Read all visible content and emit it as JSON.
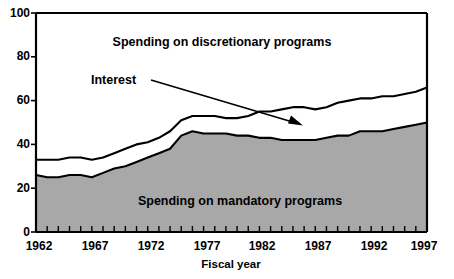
{
  "chart_data": {
    "type": "area",
    "title": "",
    "xlabel": "Fiscal year",
    "ylabel": "",
    "xlim": [
      1962,
      1997
    ],
    "ylim": [
      0,
      100
    ],
    "grid": false,
    "legend_position": "inline-annotations",
    "y_ticks": [
      "0",
      "20",
      "40",
      "60",
      "80",
      "100"
    ],
    "y_tick_values": [
      0,
      20,
      40,
      60,
      80,
      100
    ],
    "x_ticks": [
      "1962",
      "1967",
      "1972",
      "1977",
      "1982",
      "1987",
      "1992",
      "1997"
    ],
    "x_tick_values": [
      1962,
      1967,
      1972,
      1977,
      1982,
      1987,
      1992,
      1997
    ],
    "x_minor_tick_interval": 1,
    "x": [
      1962,
      1963,
      1964,
      1965,
      1966,
      1967,
      1968,
      1969,
      1970,
      1971,
      1972,
      1973,
      1974,
      1975,
      1976,
      1977,
      1978,
      1979,
      1980,
      1981,
      1982,
      1983,
      1984,
      1985,
      1986,
      1987,
      1988,
      1989,
      1990,
      1991,
      1992,
      1993,
      1994,
      1995,
      1996,
      1997
    ],
    "series": [
      {
        "name": "Spending on mandatory programs",
        "stack_order": 1,
        "fill": "#a8a8a8",
        "values": [
          26,
          25,
          25,
          26,
          26,
          25,
          27,
          29,
          30,
          32,
          34,
          36,
          38,
          44,
          46,
          45,
          45,
          45,
          44,
          44,
          43,
          43,
          42,
          42,
          42,
          42,
          43,
          44,
          44,
          46,
          46,
          46,
          47,
          48,
          49,
          50
        ]
      },
      {
        "name": "Interest",
        "stack_order": 2,
        "fill": "#ffffff",
        "cumulative_values": [
          33,
          33,
          33,
          34,
          34,
          33,
          34,
          36,
          38,
          40,
          41,
          43,
          46,
          51,
          53,
          53,
          53,
          52,
          52,
          53,
          55,
          55,
          56,
          57,
          57,
          56,
          57,
          59,
          60,
          61,
          61,
          62,
          62,
          63,
          64,
          66
        ]
      }
    ],
    "annotations": [
      {
        "name": "discretionary-label",
        "text": "Spending on discretionary programs",
        "x_px": 222,
        "y_px": 42
      },
      {
        "name": "interest-label",
        "text": "Interest",
        "x_px": 118,
        "y_px": 80
      },
      {
        "name": "mandatory-label",
        "text": "Spending on mandatory programs",
        "x_px": 240,
        "y_px": 201
      },
      {
        "name": "interest-arrow",
        "text": "",
        "from_px": [
          152,
          80
        ],
        "to_px": [
          300,
          124
        ]
      }
    ]
  },
  "labels": {
    "discretionary": "Spending on discretionary programs",
    "interest": "Interest",
    "mandatory": "Spending on mandatory programs",
    "fiscal_year": "Fiscal year"
  },
  "y_axis": {
    "t0": "0",
    "t1": "20",
    "t2": "40",
    "t3": "60",
    "t4": "80",
    "t5": "100"
  },
  "x_axis": {
    "t0": "1962",
    "t1": "1967",
    "t2": "1972",
    "t3": "1977",
    "t4": "1982",
    "t5": "1987",
    "t6": "1992",
    "t7": "1997"
  },
  "colors": {
    "mandatory_fill": "#a8a8a8",
    "interest_fill": "#ffffff",
    "line": "#000000",
    "axis": "#000000"
  }
}
